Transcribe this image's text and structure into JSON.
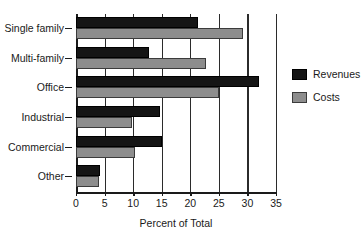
{
  "chart_data": {
    "type": "bar",
    "orientation": "horizontal",
    "title": "",
    "subtitle": "",
    "xlabel": "Percent of Total",
    "ylabel": "",
    "xlim": [
      0,
      35
    ],
    "xticks": [
      0,
      5,
      10,
      15,
      20,
      25,
      30,
      35
    ],
    "xticklabels": [
      "0",
      "5",
      "10",
      "15",
      "20",
      "25",
      "30",
      "35"
    ],
    "grid": "vertical",
    "legend_position": "right",
    "categories": [
      "Single family",
      "Multi-family",
      "Office",
      "Industrial",
      "Commercial",
      "Other"
    ],
    "series": [
      {
        "name": "Revenues",
        "color": "#151515",
        "values": [
          21.3,
          12.8,
          32.0,
          14.7,
          15.0,
          4.2
        ]
      },
      {
        "name": "Costs",
        "color": "#8d8d8d",
        "values": [
          29.3,
          22.7,
          25.0,
          9.8,
          10.4,
          4.0
        ]
      }
    ],
    "legend": [
      "Revenues",
      "Costs"
    ],
    "annotations": []
  },
  "legend": {
    "items": [
      {
        "label": "Revenues",
        "swatch": "rev"
      },
      {
        "label": "Costs",
        "swatch": "cost"
      }
    ]
  },
  "axis": {
    "x_title": "Percent of Total"
  },
  "colors": {
    "revenues": "#151515",
    "costs": "#8d8d8d",
    "axis": "#1a1a1a",
    "background": "#ffffff"
  }
}
